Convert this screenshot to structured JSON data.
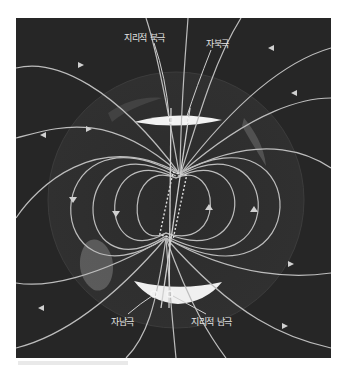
{
  "diagram": {
    "colors": {
      "background": "#262626",
      "field_line": "#bdbdbd",
      "ice_cap": "#f2f2f2",
      "globe_outline": "#3a3a3a",
      "label": "#e6e6e6"
    },
    "labels": {
      "geographic_north": "지리적 북극",
      "magnetic_north": "자북극",
      "magnetic_south": "자남극",
      "geographic_south": "지리적 남극"
    }
  }
}
